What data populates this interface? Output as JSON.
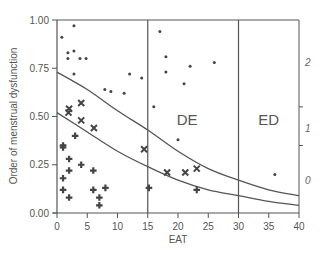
{
  "chart_data": {
    "type": "scatter",
    "title": "",
    "xlabel": "EAT",
    "ylabel": "Order of menstrual dysfunction",
    "xlim": [
      0,
      40
    ],
    "ylim": [
      0,
      1
    ],
    "x_ticks": [
      0,
      5,
      10,
      15,
      20,
      25,
      30,
      35,
      40
    ],
    "y_ticks": [
      "0.00",
      "0.25",
      "0.50",
      "0.75",
      "1.00"
    ],
    "grid": false,
    "legend": null,
    "right_axis": {
      "labels": [
        {
          "text": "2",
          "y": 0.78
        },
        {
          "text": "1",
          "y": 0.44
        },
        {
          "text": "0",
          "y": 0.17
        }
      ],
      "tick_marks_y": [
        0.55,
        0.35
      ]
    },
    "region_dividers_x": [
      15,
      30
    ],
    "regions": [
      {
        "label": "DE",
        "x": 21.5,
        "y": 0.48
      },
      {
        "label": "ED",
        "x": 35,
        "y": 0.48
      }
    ],
    "series": [
      {
        "name": "dot",
        "marker": "dot",
        "points": [
          [
            0.8,
            0.91
          ],
          [
            2.8,
            0.97
          ],
          [
            1.8,
            0.83
          ],
          [
            1.8,
            0.8
          ],
          [
            2.8,
            0.84
          ],
          [
            3.8,
            0.8
          ],
          [
            4.8,
            0.8
          ],
          [
            2.8,
            0.72
          ],
          [
            12.0,
            0.72
          ],
          [
            14.0,
            0.7
          ],
          [
            7.9,
            0.64
          ],
          [
            8.9,
            0.63
          ],
          [
            11.1,
            0.62
          ],
          [
            17.0,
            0.94
          ],
          [
            18.0,
            0.81
          ],
          [
            18.0,
            0.73
          ],
          [
            22.0,
            0.76
          ],
          [
            21.0,
            0.67
          ],
          [
            26.0,
            0.78
          ],
          [
            16.0,
            0.55
          ],
          [
            20.0,
            0.38
          ],
          [
            36.0,
            0.2
          ]
        ]
      },
      {
        "name": "x-mark",
        "marker": "x",
        "points": [
          [
            2.0,
            0.54
          ],
          [
            1.9,
            0.52
          ],
          [
            4.0,
            0.57
          ],
          [
            4.0,
            0.48
          ],
          [
            6.1,
            0.44
          ],
          [
            14.4,
            0.33
          ],
          [
            18.2,
            0.21
          ],
          [
            21.2,
            0.21
          ],
          [
            23.1,
            0.23
          ]
        ]
      },
      {
        "name": "plus",
        "marker": "plus",
        "points": [
          [
            3.0,
            0.4
          ],
          [
            1.0,
            0.35
          ],
          [
            1.0,
            0.34
          ],
          [
            2.0,
            0.28
          ],
          [
            4.0,
            0.25
          ],
          [
            2.0,
            0.22
          ],
          [
            6.0,
            0.22
          ],
          [
            1.0,
            0.18
          ],
          [
            1.0,
            0.12
          ],
          [
            6.0,
            0.12
          ],
          [
            8.0,
            0.13
          ],
          [
            7.0,
            0.08
          ],
          [
            2.0,
            0.08
          ],
          [
            7.0,
            0.04
          ],
          [
            15.2,
            0.13
          ],
          [
            23.1,
            0.12
          ]
        ]
      }
    ],
    "curves": [
      {
        "name": "upper-boundary",
        "points": [
          [
            0,
            0.73
          ],
          [
            5,
            0.64
          ],
          [
            10,
            0.53
          ],
          [
            15,
            0.43
          ],
          [
            20,
            0.32
          ],
          [
            25,
            0.23
          ],
          [
            30,
            0.17
          ],
          [
            35,
            0.12
          ],
          [
            40,
            0.09
          ]
        ]
      },
      {
        "name": "lower-boundary",
        "points": [
          [
            0,
            0.52
          ],
          [
            5,
            0.42
          ],
          [
            10,
            0.32
          ],
          [
            15,
            0.24
          ],
          [
            20,
            0.17
          ],
          [
            25,
            0.12
          ],
          [
            30,
            0.09
          ],
          [
            35,
            0.06
          ],
          [
            40,
            0.04
          ]
        ]
      }
    ]
  },
  "colors": {
    "axis": "#555555",
    "marker": "#444444",
    "curve": "#555555"
  }
}
